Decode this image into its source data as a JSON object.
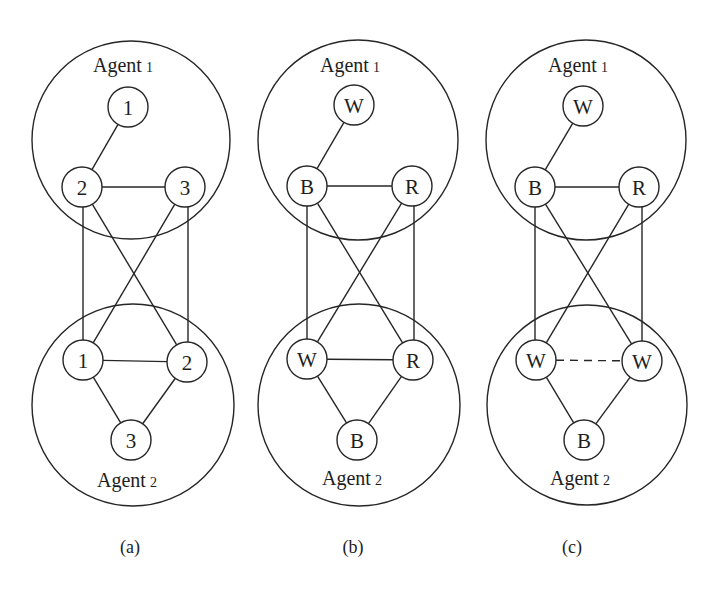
{
  "node_radius": 20,
  "colors": {
    "stroke": "#262626",
    "text": "#1e1e1e",
    "background": "#ffffff"
  },
  "panels": [
    {
      "id": "a",
      "caption": "(a)",
      "caption_pos": [
        130,
        553
      ],
      "agents": [
        {
          "name": "Agent",
          "index": "1",
          "circle": [
            131,
            140,
            99
          ],
          "label_pos": [
            93,
            72
          ]
        },
        {
          "name": "Agent",
          "index": "2",
          "circle": [
            133,
            405,
            101
          ],
          "label_pos": [
            97,
            487
          ]
        }
      ],
      "nodes": [
        {
          "id": "a1-1",
          "label": "1",
          "x": 128,
          "y": 107
        },
        {
          "id": "a1-2",
          "label": "2",
          "x": 82,
          "y": 187
        },
        {
          "id": "a1-3",
          "label": "3",
          "x": 185,
          "y": 187
        },
        {
          "id": "a2-1",
          "label": "1",
          "x": 83,
          "y": 360
        },
        {
          "id": "a2-2",
          "label": "2",
          "x": 187,
          "y": 362
        },
        {
          "id": "a2-3",
          "label": "3",
          "x": 131,
          "y": 440
        }
      ],
      "edges": [
        {
          "from": "a1-1",
          "to": "a1-2",
          "style": "solid"
        },
        {
          "from": "a1-2",
          "to": "a1-3",
          "style": "solid"
        },
        {
          "from": "a1-2",
          "to": "a2-1",
          "style": "solid",
          "vertical_x": 83
        },
        {
          "from": "a1-3",
          "to": "a2-2",
          "style": "solid",
          "vertical_x": 188
        },
        {
          "from": "a1-2",
          "to": "a2-2",
          "style": "solid"
        },
        {
          "from": "a1-3",
          "to": "a2-1",
          "style": "solid"
        },
        {
          "from": "a2-1",
          "to": "a2-2",
          "style": "solid"
        },
        {
          "from": "a2-1",
          "to": "a2-3",
          "style": "solid"
        },
        {
          "from": "a2-2",
          "to": "a2-3",
          "style": "solid"
        }
      ]
    },
    {
      "id": "b",
      "caption": "(b)",
      "caption_pos": [
        353,
        553
      ],
      "agents": [
        {
          "name": "Agent",
          "index": "1",
          "circle": [
            358,
            140,
            100
          ],
          "label_pos": [
            320,
            72
          ]
        },
        {
          "name": "Agent",
          "index": "2",
          "circle": [
            359,
            405,
            101
          ],
          "label_pos": [
            322,
            485
          ]
        }
      ],
      "nodes": [
        {
          "id": "b1-1",
          "label": "W",
          "x": 354,
          "y": 105
        },
        {
          "id": "b1-2",
          "label": "B",
          "x": 307,
          "y": 186
        },
        {
          "id": "b1-3",
          "label": "R",
          "x": 412,
          "y": 186
        },
        {
          "id": "b2-1",
          "label": "W",
          "x": 307,
          "y": 359
        },
        {
          "id": "b2-2",
          "label": "R",
          "x": 413,
          "y": 360
        },
        {
          "id": "b2-3",
          "label": "B",
          "x": 357,
          "y": 440
        }
      ],
      "edges": [
        {
          "from": "b1-1",
          "to": "b1-2",
          "style": "solid"
        },
        {
          "from": "b1-2",
          "to": "b1-3",
          "style": "solid"
        },
        {
          "from": "b1-2",
          "to": "b2-1",
          "style": "solid",
          "vertical_x": 307
        },
        {
          "from": "b1-3",
          "to": "b2-2",
          "style": "solid",
          "vertical_x": 414
        },
        {
          "from": "b1-2",
          "to": "b2-2",
          "style": "solid"
        },
        {
          "from": "b1-3",
          "to": "b2-1",
          "style": "solid"
        },
        {
          "from": "b2-1",
          "to": "b2-2",
          "style": "solid"
        },
        {
          "from": "b2-1",
          "to": "b2-3",
          "style": "solid"
        },
        {
          "from": "b2-2",
          "to": "b2-3",
          "style": "solid"
        }
      ]
    },
    {
      "id": "c",
      "caption": "(c)",
      "caption_pos": [
        572,
        553
      ],
      "agents": [
        {
          "name": "Agent",
          "index": "1",
          "circle": [
            586,
            140,
            100
          ],
          "label_pos": [
            548,
            72
          ]
        },
        {
          "name": "Agent",
          "index": "2",
          "circle": [
            587,
            405,
            100
          ],
          "label_pos": [
            550,
            485
          ]
        }
      ],
      "nodes": [
        {
          "id": "c1-1",
          "label": "W",
          "x": 583,
          "y": 106
        },
        {
          "id": "c1-2",
          "label": "B",
          "x": 535,
          "y": 187
        },
        {
          "id": "c1-3",
          "label": "R",
          "x": 639,
          "y": 187
        },
        {
          "id": "c2-1",
          "label": "W",
          "x": 536,
          "y": 360
        },
        {
          "id": "c2-2",
          "label": "W",
          "x": 642,
          "y": 361
        },
        {
          "id": "c2-3",
          "label": "B",
          "x": 584,
          "y": 440
        }
      ],
      "edges": [
        {
          "from": "c1-1",
          "to": "c1-2",
          "style": "solid"
        },
        {
          "from": "c1-2",
          "to": "c1-3",
          "style": "solid"
        },
        {
          "from": "c1-2",
          "to": "c2-1",
          "style": "solid",
          "vertical_x": 535
        },
        {
          "from": "c1-3",
          "to": "c2-2",
          "style": "solid",
          "vertical_x": 642
        },
        {
          "from": "c1-2",
          "to": "c2-2",
          "style": "solid"
        },
        {
          "from": "c1-3",
          "to": "c2-1",
          "style": "solid"
        },
        {
          "from": "c2-1",
          "to": "c2-2",
          "style": "dashed"
        },
        {
          "from": "c2-1",
          "to": "c2-3",
          "style": "solid"
        },
        {
          "from": "c2-2",
          "to": "c2-3",
          "style": "solid"
        }
      ]
    }
  ]
}
